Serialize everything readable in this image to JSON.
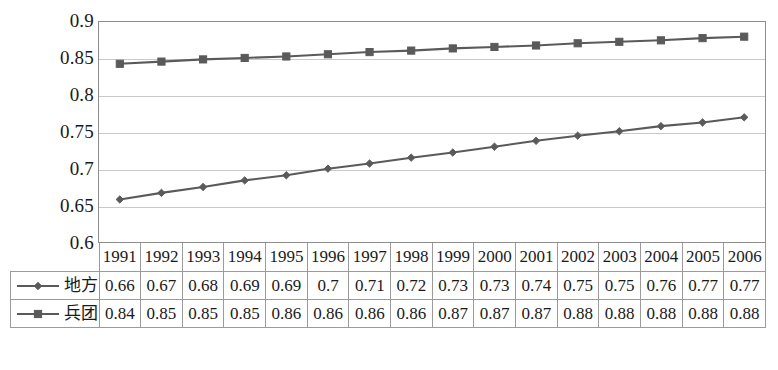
{
  "chart_data": {
    "type": "line",
    "title": "",
    "xlabel": "",
    "ylabel": "",
    "ylim": [
      0.6,
      0.9
    ],
    "yticks": [
      "0.6",
      "0.65",
      "0.7",
      "0.75",
      "0.8",
      "0.85",
      "0.9"
    ],
    "ytick_values": [
      0.6,
      0.65,
      0.7,
      0.75,
      0.8,
      0.85,
      0.9
    ],
    "grid": true,
    "legend_position": "table-left",
    "categories": [
      "1991",
      "1992",
      "1993",
      "1994",
      "1995",
      "1996",
      "1997",
      "1998",
      "1999",
      "2000",
      "2001",
      "2002",
      "2003",
      "2004",
      "2005",
      "2006"
    ],
    "series": [
      {
        "name": "地方",
        "marker": "diamond",
        "color": "#5a5a5a",
        "values": [
          0.66,
          0.67,
          0.68,
          0.69,
          0.69,
          0.7,
          0.71,
          0.72,
          0.73,
          0.73,
          0.74,
          0.75,
          0.75,
          0.76,
          0.77,
          0.77
        ],
        "labels": [
          "0.66",
          "0.67",
          "0.68",
          "0.69",
          "0.69",
          "0.7",
          "0.71",
          "0.72",
          "0.73",
          "0.73",
          "0.74",
          "0.75",
          "0.75",
          "0.76",
          "0.77",
          "0.77"
        ],
        "plotted": [
          0.658,
          0.667,
          0.675,
          0.684,
          0.691,
          0.7,
          0.707,
          0.715,
          0.722,
          0.73,
          0.738,
          0.745,
          0.751,
          0.758,
          0.763,
          0.77
        ]
      },
      {
        "name": "兵团",
        "marker": "square",
        "color": "#5a5a5a",
        "values": [
          0.84,
          0.85,
          0.85,
          0.85,
          0.86,
          0.86,
          0.86,
          0.86,
          0.87,
          0.87,
          0.87,
          0.88,
          0.88,
          0.88,
          0.88,
          0.88
        ],
        "labels": [
          "0.84",
          "0.85",
          "0.85",
          "0.85",
          "0.86",
          "0.86",
          "0.86",
          "0.86",
          "0.87",
          "0.87",
          "0.87",
          "0.88",
          "0.88",
          "0.88",
          "0.88",
          "0.88"
        ],
        "plotted": [
          0.843,
          0.846,
          0.849,
          0.851,
          0.853,
          0.856,
          0.859,
          0.861,
          0.864,
          0.866,
          0.868,
          0.871,
          0.873,
          0.875,
          0.878,
          0.88
        ]
      }
    ]
  },
  "table": {
    "corner_label": "",
    "year_header": [
      "1991",
      "1992",
      "1993",
      "1994",
      "1995",
      "1996",
      "1997",
      "1998",
      "1999",
      "2000",
      "2001",
      "2002",
      "2003",
      "2004",
      "2005",
      "2006"
    ],
    "rows": [
      {
        "label": "地方",
        "marker": "diamond",
        "values": [
          "0.66",
          "0.67",
          "0.68",
          "0.69",
          "0.69",
          "0.7",
          "0.71",
          "0.72",
          "0.73",
          "0.73",
          "0.74",
          "0.75",
          "0.75",
          "0.76",
          "0.77",
          "0.77"
        ]
      },
      {
        "label": "兵团",
        "marker": "square",
        "values": [
          "0.84",
          "0.85",
          "0.85",
          "0.85",
          "0.86",
          "0.86",
          "0.86",
          "0.86",
          "0.87",
          "0.87",
          "0.87",
          "0.88",
          "0.88",
          "0.88",
          "0.88",
          "0.88"
        ]
      }
    ]
  },
  "colors": {
    "series_line": "#5a5a5a",
    "gridline": "#c9c9c9",
    "plot_border": "#8d8d8d",
    "table_border": "#9b9b9b",
    "text": "#1a1a1a",
    "background": "#ffffff"
  }
}
